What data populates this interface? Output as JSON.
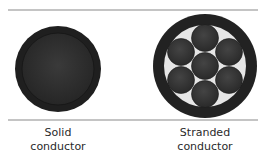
{
  "colors": {
    "line": "#8a8a8a",
    "conductor_dark": "#2b2b2b",
    "conductor_rim": "#1c1c1c",
    "insulation_light": "#e6e6e6",
    "strand": "#333333",
    "text": "#2a2a2a"
  },
  "conductors": [
    {
      "type": "solid",
      "label_line1": "Solid",
      "label_line2": "conductor"
    },
    {
      "type": "stranded",
      "strand_count": 7,
      "label_line1": "Stranded",
      "label_line2": "conductor"
    }
  ]
}
